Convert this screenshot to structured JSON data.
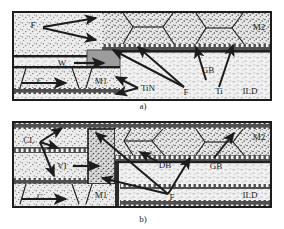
{
  "figure": {
    "background_color": "#ffffff",
    "ink_color": "#1c1c1c",
    "panels": [
      {
        "id": "a",
        "caption": "a)",
        "caption_x": 143,
        "caption_y": 108,
        "frame": {
          "x": 13,
          "y": 12,
          "w": 258,
          "h": 88
        },
        "labels": [
          {
            "name": "F",
            "text": "F",
            "x": 33,
            "y": 28
          },
          {
            "name": "W",
            "text": "W",
            "x": 62,
            "y": 63
          },
          {
            "name": "C",
            "text": "C",
            "x": 40,
            "y": 89
          },
          {
            "name": "M1",
            "text": "M1",
            "x": 101,
            "y": 87
          },
          {
            "name": "TiN",
            "text": "TiN",
            "x": 143,
            "y": 89
          },
          {
            "name": "F2",
            "text": "F",
            "x": 186,
            "y": 92
          },
          {
            "name": "GB",
            "text": "GB",
            "x": 207,
            "y": 71
          },
          {
            "name": "Ti",
            "text": "Ti",
            "x": 220,
            "y": 92
          },
          {
            "name": "ILD",
            "text": "ILD",
            "x": 248,
            "y": 92
          },
          {
            "name": "M2",
            "text": "M2",
            "x": 256,
            "y": 30
          }
        ]
      },
      {
        "id": "b",
        "caption": "b)",
        "caption_x": 143,
        "caption_y": 222,
        "frame": {
          "x": 13,
          "y": 122,
          "w": 258,
          "h": 85
        },
        "labels": [
          {
            "name": "CL",
            "text": "CL",
            "x": 29,
            "y": 141
          },
          {
            "name": "VI",
            "text": "VI",
            "x": 62,
            "y": 167
          },
          {
            "name": "C",
            "text": "C",
            "x": 40,
            "y": 198
          },
          {
            "name": "M1",
            "text": "M1",
            "x": 101,
            "y": 196
          },
          {
            "name": "DB",
            "text": "DB",
            "x": 163,
            "y": 165
          },
          {
            "name": "F",
            "text": "F",
            "x": 176,
            "y": 198
          },
          {
            "name": "GB",
            "text": "GB",
            "x": 216,
            "y": 166
          },
          {
            "name": "ILD",
            "text": "ILD",
            "x": 248,
            "y": 196
          },
          {
            "name": "M2",
            "text": "M2",
            "x": 256,
            "y": 138
          }
        ]
      }
    ],
    "legend_terms": [
      {
        "abbr": "F",
        "meaning": "flux"
      },
      {
        "abbr": "W",
        "meaning": "tungsten plug"
      },
      {
        "abbr": "C",
        "meaning": "contact"
      },
      {
        "abbr": "M1",
        "meaning": "metal level 1"
      },
      {
        "abbr": "M2",
        "meaning": "metal level 2"
      },
      {
        "abbr": "TiN",
        "meaning": "titanium nitride layer"
      },
      {
        "abbr": "Ti",
        "meaning": "titanium layer"
      },
      {
        "abbr": "GB",
        "meaning": "grain boundary"
      },
      {
        "abbr": "ILD",
        "meaning": "inter-layer dielectric"
      },
      {
        "abbr": "CL",
        "meaning": "cap layer"
      },
      {
        "abbr": "VI",
        "meaning": "via"
      },
      {
        "abbr": "DB",
        "meaning": "diffusion barrier"
      }
    ],
    "colors": {
      "ink": "#1c1c1c",
      "metal_fill": "#e6e6e6",
      "ild_fill": "#efefef",
      "plug_fill": "#9a9a9a",
      "barrier_fill": "#6a6a6a",
      "dark_band": "#2a2a2a"
    }
  }
}
